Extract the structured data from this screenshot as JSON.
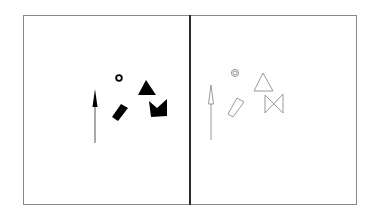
{
  "figure": {
    "colors": {
      "frame": "#8a8a8a",
      "divider": "#2a2a2a",
      "filled": "#000000",
      "outline": "#9a9a9a"
    },
    "panels": [
      {
        "name": "left-panel",
        "style": "filled",
        "shapes": [
          "small ring",
          "triangle",
          "notched square (M shape)",
          "tapered wedge",
          "vertical arrow"
        ]
      },
      {
        "name": "right-panel",
        "style": "outlined",
        "shapes": [
          "double ring",
          "triangle outline",
          "bowtie",
          "tapered wedge outline",
          "vertical arrow outline"
        ]
      }
    ]
  }
}
